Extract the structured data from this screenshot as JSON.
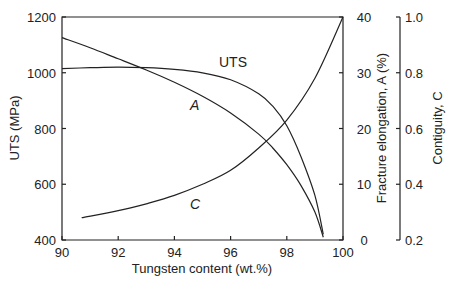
{
  "chart_data": {
    "type": "line",
    "title": "",
    "xlabel": "Tungsten content  (wt.%)",
    "xlim": [
      90,
      100
    ],
    "xticks": [
      "90",
      "92",
      "94",
      "96",
      "98",
      "100"
    ],
    "grid": false,
    "legend": "none (curves labeled inline)",
    "axes": [
      {
        "id": "left",
        "label": "UTS  (MPa)",
        "ylim": [
          400,
          1200
        ],
        "ticks": [
          "400",
          "600",
          "800",
          "1000",
          "1200"
        ]
      },
      {
        "id": "right1",
        "label": "Fracture elongation, A  (%)",
        "ylim": [
          0,
          40
        ],
        "ticks": [
          "0",
          "10",
          "20",
          "30",
          "40"
        ]
      },
      {
        "id": "right2",
        "label": "Contiguity, C",
        "ylim": [
          0.2,
          1.0
        ],
        "ticks": [
          "0.2",
          "0.4",
          "0.6",
          "0.8",
          "1.0"
        ]
      }
    ],
    "series": [
      {
        "name": "UTS",
        "axis": "left",
        "x": [
          90,
          91,
          92,
          93,
          94,
          95,
          96,
          97,
          97.5,
          98,
          98.5,
          99,
          99.3
        ],
        "values": [
          1015,
          1018,
          1020,
          1018,
          1012,
          1000,
          975,
          925,
          880,
          810,
          700,
          560,
          420
        ]
      },
      {
        "name": "A",
        "axis": "right1",
        "x": [
          90,
          91,
          92,
          93,
          94,
          95,
          96,
          97,
          97.5,
          98,
          98.5,
          99,
          99.3
        ],
        "values": [
          36.3,
          34.5,
          32.5,
          30.5,
          28.3,
          25.8,
          22.8,
          19.0,
          16.5,
          13.5,
          9.8,
          5.0,
          0.5
        ]
      },
      {
        "name": "C",
        "axis": "right2",
        "x": [
          90.7,
          92,
          93,
          94,
          95,
          96,
          97,
          98,
          99,
          100
        ],
        "values": [
          0.28,
          0.305,
          0.33,
          0.36,
          0.4,
          0.45,
          0.53,
          0.63,
          0.78,
          1.0
        ]
      }
    ],
    "labels": {
      "uts": "UTS",
      "a": "A",
      "c": "C"
    }
  }
}
